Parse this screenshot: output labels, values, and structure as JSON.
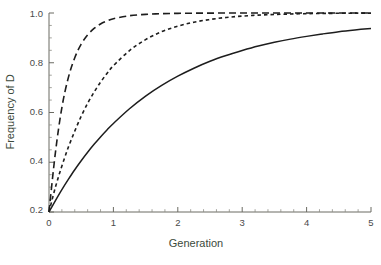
{
  "figure": {
    "name": "allele-frequency-plot",
    "background": "#ffffff",
    "axis_color": "#6b6b63",
    "curve_color": "#1d1d1d",
    "label_color": "#3c4a3c",
    "tick_label_color": "#4a4a4a"
  },
  "axes": {
    "x_title": "Generation",
    "y_title": "Frequency of D",
    "x_ticks": [
      "0",
      "1",
      "2",
      "3",
      "4",
      "5"
    ],
    "y_ticks": [
      "0.2",
      "0.4",
      "0.6",
      "0.8",
      "1.0"
    ],
    "y_origin_label": "0.2"
  },
  "caption": {
    "partial_text": ""
  },
  "chart_data": {
    "type": "line",
    "title": "",
    "xlabel": "Generation",
    "ylabel": "Frequency of D",
    "xlim": [
      0,
      5
    ],
    "ylim": [
      0.2,
      1.0
    ],
    "y_axis_origin_value": 0.2,
    "grid": false,
    "legend": "none",
    "x_major_ticks": [
      0,
      1,
      2,
      3,
      4,
      5
    ],
    "y_major_ticks": [
      0.2,
      0.4,
      0.6,
      0.8,
      1.0
    ],
    "x_minor_tick_interval": 0.2,
    "y_minor_tick_interval": 0.05,
    "x": [
      0,
      0.1,
      0.2,
      0.3,
      0.4,
      0.5,
      0.6,
      0.7,
      0.8,
      0.9,
      1.0,
      1.25,
      1.5,
      1.75,
      2.0,
      2.25,
      2.5,
      2.75,
      3.0,
      3.25,
      3.5,
      3.75,
      4.0,
      4.25,
      4.5,
      4.75,
      5.0
    ],
    "series": [
      {
        "name": "long-dashed-curve",
        "style": "long-dash",
        "dasharray": "7,4",
        "values": [
          0.2,
          0.44,
          0.62,
          0.74,
          0.82,
          0.875,
          0.912,
          0.938,
          0.956,
          0.968,
          0.977,
          0.989,
          0.9945,
          0.9972,
          0.9986,
          0.9993,
          0.9996,
          0.9998,
          0.9999,
          1.0,
          1.0,
          1.0,
          1.0,
          1.0,
          1.0,
          1.0,
          1.0
        ]
      },
      {
        "name": "short-dashed-curve",
        "style": "short-dash",
        "dasharray": "3.5,3",
        "values": [
          0.2,
          0.3,
          0.385,
          0.46,
          0.525,
          0.585,
          0.637,
          0.682,
          0.722,
          0.757,
          0.788,
          0.849,
          0.893,
          0.925,
          0.947,
          0.963,
          0.974,
          0.982,
          0.9875,
          0.9915,
          0.994,
          0.996,
          0.9975,
          0.9983,
          0.9989,
          0.9993,
          0.9995
        ]
      },
      {
        "name": "solid-curve",
        "style": "solid",
        "dasharray": "none",
        "values": [
          0.2,
          0.246,
          0.29,
          0.331,
          0.37,
          0.406,
          0.44,
          0.472,
          0.502,
          0.53,
          0.556,
          0.615,
          0.666,
          0.709,
          0.746,
          0.778,
          0.806,
          0.829,
          0.849,
          0.867,
          0.882,
          0.895,
          0.906,
          0.916,
          0.925,
          0.932,
          0.938
        ]
      }
    ]
  }
}
